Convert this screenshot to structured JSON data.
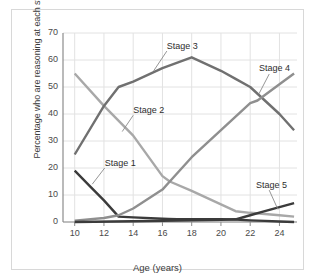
{
  "chart_data": {
    "type": "line",
    "title": "",
    "xlabel": "Age (years)",
    "ylabel": "Percentage who are reasoning at each stage",
    "xlim": [
      9.2,
      25.2
    ],
    "ylim": [
      0,
      70
    ],
    "xticks": [
      10,
      12,
      14,
      16,
      18,
      20,
      22,
      24
    ],
    "yticks": [
      0,
      10,
      20,
      30,
      40,
      50,
      60,
      70
    ],
    "grid": true,
    "legend_position": "inline-annotations",
    "series": [
      {
        "name": "Stage 1",
        "color": "#3b3b3b",
        "x": [
          10,
          11,
          12,
          13,
          14,
          16,
          16.4,
          17,
          18,
          20,
          21,
          22,
          23,
          24,
          25
        ],
        "values": [
          19,
          13.5,
          8,
          2,
          1.7,
          1.2,
          1.1,
          1,
          1,
          1,
          0.9,
          0.6,
          0.4,
          0.2,
          0
        ]
      },
      {
        "name": "Stage 2",
        "color": "#a8a8a8",
        "x": [
          10,
          12,
          14,
          16,
          16.5,
          18,
          20,
          21,
          22,
          24,
          25
        ],
        "values": [
          55,
          43,
          32,
          17,
          15,
          11.5,
          6.5,
          4,
          3.4,
          2.5,
          2
        ]
      },
      {
        "name": "Stage 3",
        "color": "#707070",
        "x": [
          10,
          12,
          13,
          14,
          16,
          18,
          20,
          21,
          22,
          24,
          25
        ],
        "values": [
          25,
          43,
          50,
          52,
          57,
          61,
          56,
          53,
          50,
          40,
          34
        ]
      },
      {
        "name": "Stage 4",
        "color": "#8f8f8f",
        "x": [
          10,
          12,
          13,
          14,
          16,
          16.5,
          18,
          20,
          22,
          22.5,
          24,
          25
        ],
        "values": [
          0.5,
          1.5,
          2.5,
          5,
          12,
          15,
          24,
          34,
          44,
          45,
          51,
          55
        ]
      },
      {
        "name": "Stage 5",
        "color": "#3b3b3b",
        "x": [
          10,
          14,
          18,
          20,
          21,
          22,
          23,
          24,
          25
        ],
        "values": [
          0,
          0.3,
          0.6,
          0.8,
          1,
          2.5,
          4,
          5.5,
          7
        ]
      }
    ],
    "annotations": [
      {
        "text": "Stage 1",
        "x": 12.05,
        "y": 21.5
      },
      {
        "text": "Stage 2",
        "x": 14.0,
        "y": 41.0
      },
      {
        "text": "Stage 3",
        "x": 16.3,
        "y": 65.0
      },
      {
        "text": "Stage 4",
        "x": 22.6,
        "y": 56.5
      },
      {
        "text": "Stage 5",
        "x": 22.4,
        "y": 13.5
      }
    ]
  }
}
